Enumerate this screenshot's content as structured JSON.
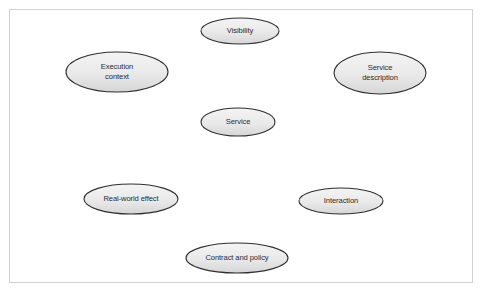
{
  "diagram": {
    "type": "concept-ellipse-diagram",
    "background_color": "#ffffff",
    "frame": {
      "border_color": "#d2d2d2",
      "fill_color": "#ffffff"
    },
    "node_style": {
      "stroke_color": "#2f2f2f",
      "fill_top_color": "#f2f2f2",
      "fill_bottom_color": "#d8d8d8",
      "text_color": "#2b2b2b"
    },
    "nodes": [
      {
        "id": "visibility",
        "label": "Visibility",
        "lines": [
          "Visibility"
        ],
        "cx": 240,
        "cy": 31,
        "rx": 39,
        "ry": 13
      },
      {
        "id": "execution-context",
        "label": "Execution context",
        "lines": [
          "Execution",
          "context"
        ],
        "cx": 117,
        "cy": 72,
        "rx": 51,
        "ry": 20
      },
      {
        "id": "service-description",
        "label": "Service description",
        "lines": [
          "Service",
          "description"
        ],
        "cx": 380,
        "cy": 73,
        "rx": 46,
        "ry": 21
      },
      {
        "id": "service",
        "label": "Service",
        "lines": [
          "Service"
        ],
        "cx": 238,
        "cy": 122,
        "rx": 37,
        "ry": 14
      },
      {
        "id": "real-world-effect",
        "label": "Real-world effect",
        "lines": [
          "Real-world effect"
        ],
        "cx": 131,
        "cy": 199,
        "rx": 47,
        "ry": 15
      },
      {
        "id": "interaction",
        "label": "Interaction",
        "lines": [
          "Interaction"
        ],
        "cx": 341,
        "cy": 201,
        "rx": 42,
        "ry": 13
      },
      {
        "id": "contract-and-policy",
        "label": "Contract and policy",
        "lines": [
          "Contract and policy"
        ],
        "cx": 237,
        "cy": 258,
        "rx": 51,
        "ry": 15
      }
    ]
  }
}
